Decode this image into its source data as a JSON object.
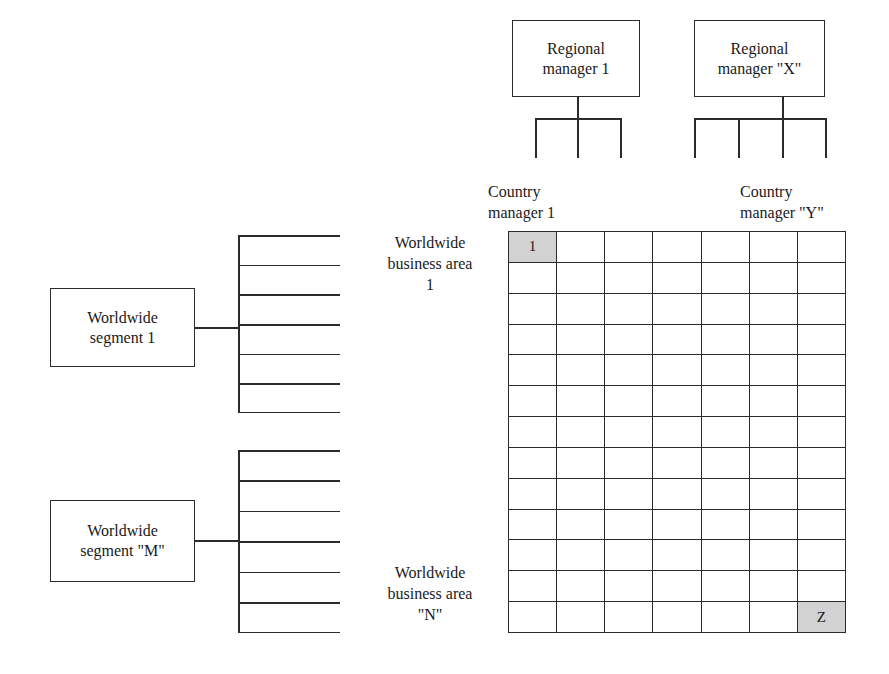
{
  "diagram": {
    "line_color": "#2b2b2b",
    "shade_color": "#d2d2d2",
    "background": "#ffffff"
  },
  "regional_managers": [
    {
      "label": "Regional\nmanager 1",
      "reports_count": 3
    },
    {
      "label": "Regional\nmanager \"X\"",
      "reports_count": 4
    }
  ],
  "country_managers": [
    {
      "label": "Country\nmanager 1"
    },
    {
      "label": "Country\nmanager \"Y\""
    }
  ],
  "worldwide_segments": [
    {
      "label": "Worldwide\nsegment 1",
      "slots": 6
    },
    {
      "label": "Worldwide\nsegment \"M\"",
      "slots": 6
    }
  ],
  "business_areas": [
    {
      "label": "Worldwide\nbusiness area\n1"
    },
    {
      "label": "Worldwide\nbusiness area\n\"N\""
    }
  ],
  "matrix": {
    "columns": 7,
    "rows": 13,
    "cells": [
      {
        "row": 0,
        "col": 0,
        "value": "1",
        "shaded": true
      },
      {
        "row": 12,
        "col": 6,
        "value": "Z",
        "shaded": true
      }
    ],
    "first_cell_value": "1",
    "last_cell_value": "Z"
  }
}
